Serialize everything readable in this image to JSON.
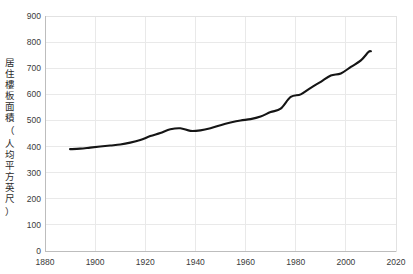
{
  "chart_data": {
    "type": "line",
    "title": "",
    "xlabel": "",
    "ylabel": "居住樓板面積（人均平方英尺）",
    "ylabel_chars": [
      "居",
      "住",
      "樓",
      "板",
      "面",
      "積",
      "（",
      "人",
      "均",
      "平",
      "方",
      "英",
      "尺",
      "）"
    ],
    "xlim": [
      1880,
      2020
    ],
    "ylim": [
      0,
      900
    ],
    "xticks": [
      1880,
      1900,
      1920,
      1940,
      1960,
      1980,
      2000,
      2020
    ],
    "xticklabels": [
      "1880",
      "1900",
      "1920",
      "1940",
      "1960",
      "1980",
      "2000",
      "2020"
    ],
    "yticks": [
      0,
      100,
      200,
      300,
      400,
      500,
      600,
      700,
      800,
      900
    ],
    "yticklabels": [
      "0",
      "100",
      "200",
      "300",
      "400",
      "500",
      "600",
      "700",
      "800",
      "900"
    ],
    "grid": true,
    "legend": "none",
    "series": [
      {
        "name": "居住樓板面積",
        "color": "#151515",
        "x": [
          1890,
          1894,
          1898,
          1902,
          1906,
          1910,
          1914,
          1918,
          1922,
          1926,
          1930,
          1934,
          1938,
          1942,
          1946,
          1950,
          1954,
          1958,
          1962,
          1966,
          1970,
          1974,
          1978,
          1982,
          1986,
          1990,
          1994,
          1998,
          2002,
          2006,
          2009,
          2010
        ],
        "values": [
          390,
          392,
          396,
          400,
          404,
          408,
          415,
          425,
          440,
          452,
          466,
          470,
          460,
          462,
          470,
          482,
          492,
          500,
          505,
          515,
          532,
          545,
          590,
          600,
          625,
          648,
          672,
          680,
          705,
          730,
          762,
          765
        ]
      }
    ]
  }
}
